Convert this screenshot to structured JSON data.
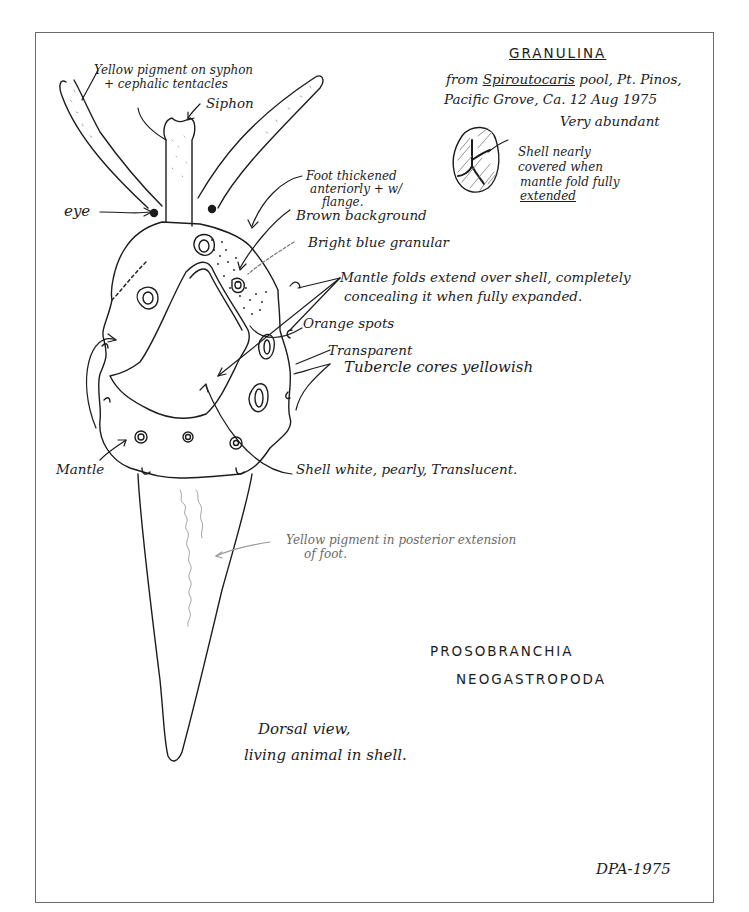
{
  "species_header": {
    "genus": "GRANULINA",
    "collection_line1_prefix": "from ",
    "collection_line1_host": "Spiroutocaris",
    "collection_line1_suffix": " pool, Pt. Pinos,",
    "collection_line2": "Pacific Grove, Ca.   12 Aug 1975",
    "abundance": "Very abundant"
  },
  "shell_inset": {
    "note_line1": "Shell nearly",
    "note_line2": "covered when",
    "note_line3": "mantle fold fully",
    "note_line4": "extended"
  },
  "labels": {
    "yellow_pigment_siphon_line1": "Yellow pigment on syphon",
    "yellow_pigment_siphon_line2": "+ cephalic tentacles",
    "siphon": "Siphon",
    "eye": "eye",
    "foot_thickened_line1": "Foot thickened",
    "foot_thickened_line2": "anteriorly + w/",
    "foot_thickened_line3": "flange.",
    "brown_background": "Brown background",
    "bright_blue_granular": "Bright blue granular",
    "mantle_folds_line1": "Mantle folds extend over shell, completely",
    "mantle_folds_line2": "concealing it when fully expanded.",
    "orange_spots": "Orange spots",
    "transparent": "Transparent",
    "tubercle_cores": "Tubercle cores yellowish",
    "mantle": "Mantle",
    "shell_description": "Shell white, pearly, Translucent.",
    "yellow_pigment_foot_line1": "Yellow pigment in posterior extension",
    "yellow_pigment_foot_line2": "of foot."
  },
  "taxonomy": {
    "order": "PROSOBRANCHIA",
    "suborder": "NEOGASTROPODA"
  },
  "caption": {
    "line1": "Dorsal view,",
    "line2": "living animal in shell."
  },
  "signature": "DPA-1975"
}
